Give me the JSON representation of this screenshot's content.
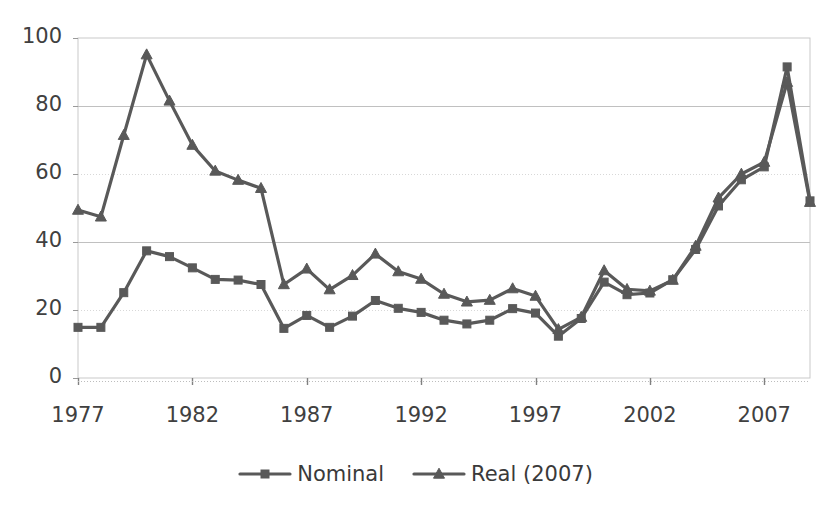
{
  "chart_data": {
    "type": "line",
    "title": "",
    "xlabel": "",
    "ylabel": "",
    "x": [
      1977,
      1978,
      1979,
      1980,
      1981,
      1982,
      1983,
      1984,
      1985,
      1986,
      1987,
      1988,
      1989,
      1990,
      1991,
      1992,
      1993,
      1994,
      1995,
      1996,
      1997,
      1998,
      1999,
      2000,
      2001,
      2002,
      2003,
      2004,
      2005,
      2006,
      2007,
      2008,
      2009
    ],
    "xlim": [
      1977,
      2009
    ],
    "ylim": [
      0,
      100
    ],
    "xticks": [
      1977,
      1982,
      1987,
      1992,
      1997,
      2002,
      2007
    ],
    "xtick_labels": [
      "1977",
      "1982",
      "1987",
      "1992",
      "1997",
      "2002",
      "2007"
    ],
    "yticks": [
      0,
      20,
      40,
      60,
      80,
      100
    ],
    "ytick_labels": [
      "0",
      "20",
      "40",
      "60",
      "80",
      "100"
    ],
    "grid": "horizontal",
    "legend_position": "bottom",
    "series": [
      {
        "name": "Nominal",
        "marker": "square",
        "color": "#595959",
        "values": [
          14.9,
          14.9,
          25.1,
          37.4,
          35.7,
          32.4,
          29.0,
          28.8,
          27.5,
          14.6,
          18.4,
          14.9,
          18.2,
          22.8,
          20.5,
          19.3,
          17.0,
          15.9,
          17.0,
          20.4,
          19.1,
          12.3,
          17.5,
          28.2,
          24.5,
          25.0,
          28.9,
          37.8,
          50.6,
          58.3,
          62.1,
          91.5,
          52.1
        ]
      },
      {
        "name": "Real (2007)",
        "marker": "triangle",
        "color": "#595959",
        "values": [
          49.4,
          47.4,
          71.4,
          95.1,
          81.5,
          68.5,
          60.9,
          58.2,
          55.8,
          27.5,
          32.1,
          26.0,
          30.2,
          36.5,
          31.3,
          29.1,
          24.7,
          22.4,
          22.9,
          26.3,
          24.1,
          14.3,
          17.9,
          31.6,
          26.1,
          25.6,
          28.8,
          38.8,
          53.0,
          60.0,
          63.5,
          87.0,
          51.7
        ]
      }
    ]
  },
  "legend": {
    "entries": [
      {
        "label": "Nominal",
        "marker": "square-marker-icon"
      },
      {
        "label": "Real (2007)",
        "marker": "triangle-marker-icon"
      }
    ]
  },
  "axes": {
    "y_axis_name": "value-axis",
    "x_axis_name": "year-axis"
  }
}
